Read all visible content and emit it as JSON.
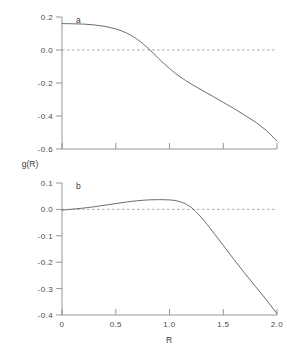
{
  "figure": {
    "ylabel": "g(R)",
    "xlabel": "R"
  },
  "chart_data": [
    {
      "type": "line",
      "panel": "a",
      "title": "a",
      "xlabel": "",
      "ylabel": "g(R)",
      "xlim": [
        0,
        2.0
      ],
      "ylim": [
        -0.6,
        0.2
      ],
      "xticks": [
        0,
        0.5,
        1.0,
        1.5,
        2.0
      ],
      "xticklabels": [
        "",
        "",
        "",
        "",
        ""
      ],
      "yticks": [
        0.2,
        0.0,
        -0.2,
        -0.4,
        -0.6
      ],
      "yticklabels": [
        "0.2",
        "0.0",
        "-0.2",
        "-0.4",
        "-0.6"
      ],
      "grid": false,
      "legend": "none",
      "zero_reference_line": true,
      "zero_crossing_x": 0.82,
      "x": [
        0.0,
        0.1,
        0.2,
        0.3,
        0.4,
        0.5,
        0.55,
        0.6,
        0.65,
        0.7,
        0.75,
        0.8,
        0.85,
        0.9,
        0.95,
        1.0,
        1.05,
        1.1,
        1.15,
        1.2,
        1.3,
        1.4,
        1.5,
        1.6,
        1.7,
        1.8,
        1.9,
        2.0
      ],
      "values": [
        0.16,
        0.159,
        0.157,
        0.152,
        0.143,
        0.128,
        0.117,
        0.103,
        0.086,
        0.065,
        0.04,
        0.011,
        -0.02,
        -0.052,
        -0.083,
        -0.112,
        -0.139,
        -0.163,
        -0.185,
        -0.205,
        -0.243,
        -0.28,
        -0.317,
        -0.355,
        -0.395,
        -0.437,
        -0.487,
        -0.552
      ]
    },
    {
      "type": "line",
      "panel": "b",
      "title": "b",
      "xlabel": "R",
      "ylabel": "g(R)",
      "xlim": [
        0,
        2.0
      ],
      "ylim": [
        -0.4,
        0.1
      ],
      "xticks": [
        0,
        0.5,
        1.0,
        1.5,
        2.0
      ],
      "xticklabels": [
        "0",
        "0.5",
        "1.0",
        "1.5",
        "2.0"
      ],
      "yticks": [
        0.1,
        0.0,
        -0.1,
        -0.2,
        -0.3,
        -0.4
      ],
      "yticklabels": [
        "0.1",
        "0.0",
        "-0.1",
        "-0.2",
        "-0.3",
        "-0.4"
      ],
      "grid": false,
      "legend": "none",
      "zero_reference_line": true,
      "zero_crossing_x": 1.2,
      "peak": {
        "x": 1.0,
        "y": 0.036
      },
      "x": [
        0.0,
        0.1,
        0.2,
        0.3,
        0.4,
        0.5,
        0.6,
        0.7,
        0.8,
        0.9,
        1.0,
        1.05,
        1.1,
        1.15,
        1.2,
        1.25,
        1.3,
        1.35,
        1.4,
        1.5,
        1.6,
        1.7,
        1.8,
        1.9,
        2.0
      ],
      "values": [
        -0.003,
        0.001,
        0.005,
        0.01,
        0.016,
        0.022,
        0.028,
        0.033,
        0.036,
        0.037,
        0.036,
        0.034,
        0.029,
        0.021,
        0.008,
        -0.01,
        -0.032,
        -0.057,
        -0.083,
        -0.136,
        -0.19,
        -0.242,
        -0.292,
        -0.342,
        -0.395
      ]
    }
  ]
}
